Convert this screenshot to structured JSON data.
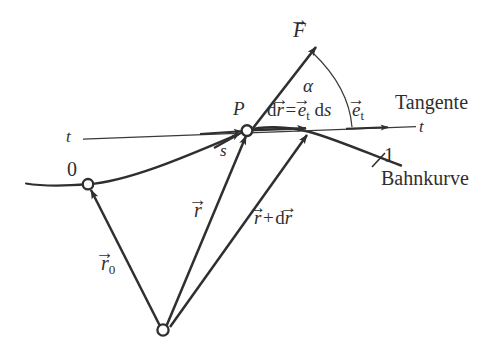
{
  "figure": {
    "type": "physics-vector-diagram",
    "background_color": "#ffffff",
    "ink_color": "#2f2f2f",
    "labels": {
      "force_vector": "F",
      "angle": "α",
      "point_p": "P",
      "arclength": "s",
      "position_vector": "r",
      "position_vector_sub": "0",
      "displacement_equation_lhs_d": "d",
      "displacement_equation_lhs_r": "r",
      "displacement_equation_eq": "=",
      "displacement_equation_e": "e",
      "displacement_equation_e_sub": "t",
      "displacement_equation_ds": "d",
      "displacement_equation_s": "s",
      "unit_tangent": "e",
      "unit_tangent_sub": "t",
      "tangent_line_left": "t",
      "tangent_line_right": "t",
      "tangent_name": "Tangente",
      "path_name": "Bahnkurve",
      "point_zero": "0",
      "point_one": "1",
      "r_plus_dr_r": "r",
      "r_plus_dr_plus": "+",
      "r_plus_dr_d": "d",
      "r_plus_dr_dr": "r",
      "vector_arrow": "→"
    }
  },
  "geometry": {
    "origin_point": {
      "x": 163,
      "y": 330,
      "label": ""
    },
    "point_zero": {
      "x": 88,
      "y": 184,
      "label": "0"
    },
    "point_p": {
      "x": 247,
      "y": 130,
      "label": "P"
    },
    "point_dr_end": {
      "x": 310,
      "y": 129,
      "label": ""
    },
    "force_arrow_tip": {
      "x": 318,
      "y": 45
    },
    "tangent_left_end": {
      "x": 83,
      "y": 139
    },
    "tangent_right_end": {
      "x": 416,
      "y": 127
    },
    "curve_left_end": {
      "x": 26,
      "y": 184
    },
    "curve_right_end": {
      "x": 401,
      "y": 166
    },
    "tick_one": {
      "x": 378,
      "y": 160
    }
  }
}
